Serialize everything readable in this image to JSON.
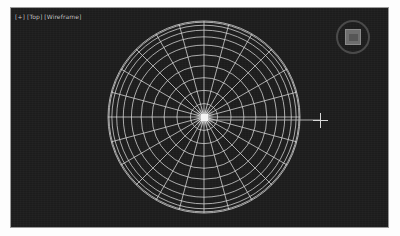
{
  "viewport": {
    "label": "[+] [Top] [Wireframe]",
    "label_parts": {
      "expand": "[+]",
      "view": "[Top]",
      "shading": "[Wireframe]"
    },
    "background_color": "#1c1c1c",
    "wire_color": "#d7d7d7",
    "axis_color": "#b9b9b9",
    "selection_color": "#f4f4f4",
    "bounds": {
      "x": 11,
      "y": 8,
      "width": 377,
      "height": 219
    }
  },
  "scene": {
    "object": {
      "name": "Sphere",
      "display_mode": "Wireframe",
      "center": {
        "x": 193,
        "y": 109
      },
      "radius": 96,
      "segments": 24,
      "rings": 11,
      "selected": true
    },
    "pivot_marker": {
      "x": 190,
      "y": 106,
      "size": 7
    },
    "transform_gizmo": {
      "axis": "X",
      "start_x": 193,
      "end_x": 310,
      "y": 112
    }
  },
  "cursor": {
    "type": "crosshair",
    "x": 302,
    "y": 105
  },
  "nav_gizmo": {
    "name": "view-cube",
    "x": 325,
    "y": 12,
    "size": 34,
    "ring_color": "#4a4a4a",
    "cube_color": "#6e6e6e"
  }
}
